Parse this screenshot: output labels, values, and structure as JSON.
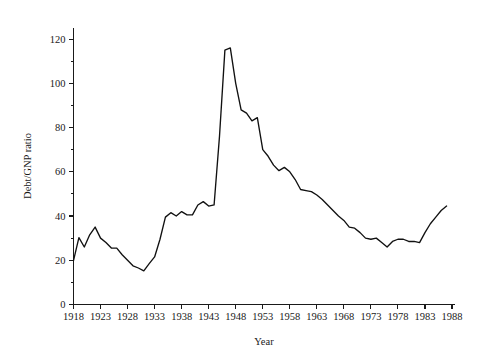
{
  "chart_data": {
    "type": "line",
    "title": "",
    "xlabel": "Year",
    "ylabel": "Debt/GNP ratio",
    "xlim": [
      1918,
      1988
    ],
    "ylim": [
      0,
      125
    ],
    "grid": false,
    "legend": null,
    "x_ticks": [
      1918,
      1923,
      1928,
      1933,
      1938,
      1943,
      1948,
      1953,
      1958,
      1963,
      1968,
      1973,
      1978,
      1983,
      1988
    ],
    "x_tick_labels": [
      "1918",
      "1923",
      "1928",
      "1933",
      "1938",
      "1943",
      "1948",
      "1953",
      "1958",
      "1963",
      "1968",
      "1973",
      "1978",
      "1983",
      "1988"
    ],
    "y_ticks": [
      0,
      20,
      40,
      60,
      80,
      100,
      120
    ],
    "y_tick_labels": [
      "0",
      "20",
      "40",
      "60",
      "80",
      "100",
      "120"
    ],
    "y_minor_ticks": [
      10,
      30,
      50,
      70,
      90,
      110
    ],
    "line_color": "#111111",
    "x": [
      1918,
      1919,
      1920,
      1921,
      1922,
      1923,
      1924,
      1925,
      1926,
      1927,
      1928,
      1929,
      1930,
      1931,
      1932,
      1933,
      1934,
      1935,
      1936,
      1937,
      1938,
      1939,
      1940,
      1941,
      1942,
      1943,
      1944,
      1945,
      1946,
      1947,
      1948,
      1949,
      1950,
      1951,
      1952,
      1953,
      1954,
      1955,
      1956,
      1957,
      1958,
      1959,
      1960,
      1961,
      1962,
      1963,
      1964,
      1965,
      1966,
      1967,
      1968,
      1969,
      1970,
      1971,
      1972,
      1973,
      1974,
      1975,
      1976,
      1977,
      1978,
      1979,
      1980,
      1981,
      1982,
      1983,
      1984,
      1985,
      1986,
      1987
    ],
    "y": [
      19.8,
      30.2,
      26.0,
      31.5,
      35.0,
      30.0,
      28.0,
      25.5,
      25.5,
      22.5,
      20.0,
      17.5,
      16.5,
      15.2,
      18.5,
      21.5,
      29.5,
      39.5,
      41.5,
      40.0,
      42.0,
      40.5,
      40.5,
      45.0,
      46.5,
      44.5,
      45.0,
      76.0,
      115.0,
      116.0,
      100.0,
      88.0,
      86.5,
      83.0,
      84.5,
      70.0,
      67.0,
      63.0,
      60.5,
      62.0,
      60.0,
      56.5,
      52.0,
      51.5,
      51.0,
      49.5,
      47.5,
      45.0,
      42.5,
      40.0,
      38.0,
      35.0,
      34.5,
      32.5,
      30.0,
      29.5,
      30.0,
      28.0,
      26.0,
      28.5,
      29.5,
      29.5,
      28.5,
      28.5,
      28.0,
      32.5,
      36.5,
      39.5,
      42.5,
      44.5,
      44.5
    ]
  },
  "axes": {
    "y_axis_title": "Debt/GNP ratio",
    "x_axis_title": "Year"
  }
}
